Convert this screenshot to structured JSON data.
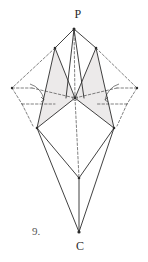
{
  "figure": {
    "caption_number": "9.",
    "apex_label": "P",
    "base_label": "C",
    "background_color": "#ffffff",
    "stroke_color": "#2b2b2b",
    "dash_color": "#4a4a4a",
    "fill_color": "#eceaea"
  },
  "points": {
    "P": {
      "x": 74,
      "y": 29,
      "label": "P"
    },
    "UL": {
      "x": 55,
      "y": 48,
      "label": ""
    },
    "UR": {
      "x": 96,
      "y": 48,
      "label": ""
    },
    "O": {
      "x": 75,
      "y": 98,
      "label": ""
    },
    "LL": {
      "x": 37,
      "y": 128,
      "label": ""
    },
    "LR": {
      "x": 114,
      "y": 128,
      "label": ""
    },
    "M": {
      "x": 79,
      "y": 178,
      "label": ""
    },
    "C": {
      "x": 79,
      "y": 232,
      "label": "C"
    },
    "FL": {
      "x": 12,
      "y": 88,
      "label": ""
    },
    "FR": {
      "x": 137,
      "y": 88,
      "label": ""
    },
    "DL": {
      "x": 22,
      "y": 104,
      "label": ""
    },
    "DR": {
      "x": 127,
      "y": 104,
      "label": ""
    },
    "DL2": {
      "x": 32,
      "y": 88,
      "label": ""
    },
    "DR2": {
      "x": 117,
      "y": 88,
      "label": ""
    },
    "BL": {
      "x": 31,
      "y": 122,
      "label": ""
    },
    "BR": {
      "x": 118,
      "y": 122,
      "label": ""
    }
  },
  "solid_edges": [
    {
      "name": "P-UL",
      "from": "P",
      "to": "UL"
    },
    {
      "name": "P-UR",
      "from": "P",
      "to": "UR"
    },
    {
      "name": "P-O-left",
      "from": "P",
      "to": "O"
    },
    {
      "name": "UL-O",
      "from": "UL",
      "to": "O"
    },
    {
      "name": "UR-O",
      "from": "UR",
      "to": "O"
    },
    {
      "name": "UL-LL",
      "from": "UL",
      "to": "LL"
    },
    {
      "name": "UR-LR",
      "from": "UR",
      "to": "LR"
    },
    {
      "name": "O-LL",
      "from": "O",
      "to": "LL"
    },
    {
      "name": "O-LR",
      "from": "O",
      "to": "LR"
    },
    {
      "name": "LL-M",
      "from": "LL",
      "to": "M"
    },
    {
      "name": "LR-M",
      "from": "LR",
      "to": "M"
    },
    {
      "name": "LL-C",
      "from": "LL",
      "to": "C"
    },
    {
      "name": "LR-C",
      "from": "LR",
      "to": "C"
    },
    {
      "name": "M-C",
      "from": "M",
      "to": "C"
    }
  ],
  "dashed_edges": [
    {
      "name": "axis-P-O",
      "from": "P",
      "to": "O"
    },
    {
      "name": "axis-O-M",
      "from": "O",
      "to": "M"
    },
    {
      "name": "left-UL-FL",
      "from": "UL",
      "to": "FL"
    },
    {
      "name": "left-FL-DL2",
      "from": "FL",
      "to": "DL2"
    },
    {
      "name": "left-FL-DL",
      "from": "FL",
      "to": "DL"
    },
    {
      "name": "left-DL-BL",
      "from": "DL",
      "to": "BL"
    },
    {
      "name": "left-DL2-O",
      "from": "DL2",
      "to": "O"
    },
    {
      "name": "left-BL-LL",
      "from": "BL",
      "to": "LL"
    },
    {
      "name": "right-UR-FR",
      "from": "UR",
      "to": "FR"
    },
    {
      "name": "right-FR-DR2",
      "from": "FR",
      "to": "DR2"
    },
    {
      "name": "right-FR-DR",
      "from": "FR",
      "to": "DR"
    },
    {
      "name": "right-DR-BR",
      "from": "DR",
      "to": "BR"
    },
    {
      "name": "right-DR2-O",
      "from": "DR2",
      "to": "O"
    },
    {
      "name": "right-BR-LR",
      "from": "BR",
      "to": "LR"
    }
  ],
  "shaded_faces": [
    {
      "name": "left-shaded-face",
      "vertices": "55,48 75,98 37,128"
    },
    {
      "name": "right-shaded-face",
      "vertices": "96,48 75,98 114,128"
    }
  ],
  "angle_arcs": [
    {
      "name": "left-angle-arc",
      "path": "M 30,84 A 20,20 0 0 1 44,100"
    },
    {
      "name": "right-angle-arc",
      "path": "M 119,84 A 20,20 0 0 0 105,100"
    }
  ]
}
